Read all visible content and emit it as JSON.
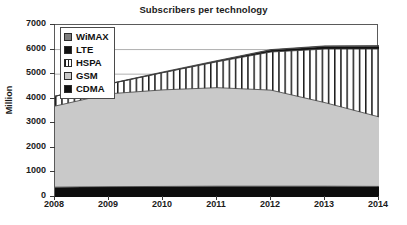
{
  "chart_data": {
    "type": "area",
    "title": "Subscribers per technology",
    "xlabel": "",
    "ylabel": "Million",
    "stacked": true,
    "grid": true,
    "legend_position": "top-left-inside",
    "x": [
      2008,
      2009,
      2010,
      2011,
      2012,
      2013,
      2014
    ],
    "categories": [
      "2008",
      "2009",
      "2010",
      "2011",
      "2012",
      "2013",
      "2014"
    ],
    "xlim": [
      2008,
      2014
    ],
    "ylim": [
      0,
      7000
    ],
    "yticks": [
      0,
      1000,
      2000,
      3000,
      4000,
      5000,
      6000,
      7000
    ],
    "ytick_labels": [
      "0",
      "1000",
      "2000",
      "3000",
      "4000",
      "5000",
      "6000",
      "7000"
    ],
    "xticks": [
      2008,
      2009,
      2010,
      2011,
      2012,
      2013,
      2014
    ],
    "xtick_labels": [
      "2008",
      "2009",
      "2010",
      "2011",
      "2012",
      "2013",
      "2014"
    ],
    "series": [
      {
        "name": "CDMA",
        "color": "#0d0d0d",
        "fill": "solid",
        "values": [
          400,
          420,
          430,
          440,
          440,
          440,
          430
        ]
      },
      {
        "name": "GSM",
        "color": "#c9c9c9",
        "fill": "solid",
        "values": [
          3300,
          3780,
          3930,
          4010,
          3910,
          3400,
          2830
        ]
      },
      {
        "name": "HSPA",
        "color": "#ffffff",
        "fill": "vertical-hatch",
        "values": [
          400,
          400,
          700,
          1050,
          1550,
          2180,
          2760
        ]
      },
      {
        "name": "LTE",
        "color": "#111111",
        "fill": "solid",
        "values": [
          0,
          0,
          10,
          30,
          80,
          110,
          120
        ]
      },
      {
        "name": "WiMAX",
        "color": "#7d7d7d",
        "fill": "solid",
        "values": [
          0,
          10,
          20,
          20,
          20,
          20,
          20
        ]
      }
    ],
    "cumulative_totals": [
      4100,
      4610,
      5090,
      5550,
      6000,
      6150,
      6160
    ],
    "annotations": []
  },
  "legend": {
    "items": [
      {
        "label": "WiMAX",
        "color": "#7d7d7d",
        "pattern": "solid"
      },
      {
        "label": "LTE",
        "color": "#111111",
        "pattern": "solid"
      },
      {
        "label": "HSPA",
        "color": "#ffffff",
        "pattern": "vertical-hatch"
      },
      {
        "label": "GSM",
        "color": "#c9c9c9",
        "pattern": "solid"
      },
      {
        "label": "CDMA",
        "color": "#111111",
        "pattern": "solid"
      }
    ]
  }
}
